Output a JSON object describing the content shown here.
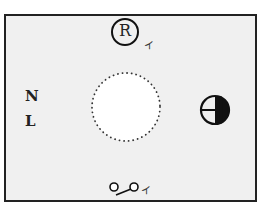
{
  "diagram": {
    "type": "electrical-wiring-symbol-diagram",
    "background": "#f0f0f0",
    "border_color": "#222222",
    "symbols": {
      "top_circle_letter": "R",
      "top_circle_annotation": "イ",
      "left_labels": [
        "N",
        "L"
      ],
      "center_shape": "dotted-circle",
      "right_symbol": "half-filled-circle-outlet",
      "bottom_switch_annotation": "イ"
    }
  }
}
